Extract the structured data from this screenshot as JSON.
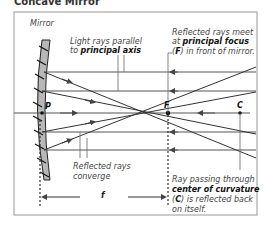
{
  "title": "Concave Mirror",
  "labels": {
    "mirror": "Mirror",
    "parallel_rays_1": "Light rays parallel",
    "parallel_rays_2_pre": "to ",
    "parallel_rays_2_bold": "principal axis",
    "focus_1": "Reflected rays meet",
    "focus_2_pre": "at ",
    "focus_2_bold": "principal focus",
    "focus_3_open": "(",
    "focus_3_bold": "F",
    "focus_3_post": ") in front of mirror.",
    "converge_1": "Reflected rays",
    "converge_2": "converge",
    "curvature_1": "Ray passing through",
    "curvature_2_bold": "center of curvature",
    "curvature_3_open": "(",
    "curvature_3_bold": "C",
    "curvature_3_post": ") is reflected back",
    "curvature_4": "on itself."
  },
  "points": {
    "P": "P",
    "F": "F",
    "C": "C"
  },
  "focal_length_label": "f",
  "colors": {
    "mirror_fill": "#b8b8b8",
    "line": "#555555",
    "frame": "#999999"
  }
}
